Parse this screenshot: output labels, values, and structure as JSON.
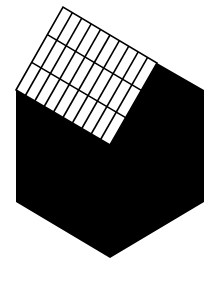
{
  "image": {
    "description": "Black hexagon-like shape with a tilted white grid panel on its upper-left face",
    "width": 218,
    "height": 281,
    "background": "#ffffff"
  },
  "colors": {
    "shape_fill": "#000000",
    "panel_fill": "#ffffff",
    "grid_line": "#000000"
  },
  "shape": {
    "points": [
      [
        16,
        90
      ],
      [
        110,
        145
      ],
      [
        157,
        63
      ],
      [
        204,
        90
      ],
      [
        204,
        202
      ],
      [
        110,
        258
      ],
      [
        16,
        202
      ]
    ]
  },
  "panel": {
    "corners": {
      "left": [
        16,
        90
      ],
      "top": [
        63,
        7
      ],
      "right": [
        157,
        63
      ],
      "bottom": [
        110,
        145
      ]
    },
    "rows": 3,
    "columns": 10
  }
}
